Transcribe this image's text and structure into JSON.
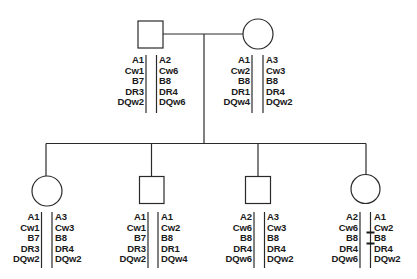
{
  "diagram": {
    "type": "pedigree",
    "line_color": "#2a2a2a",
    "loci": [
      "A",
      "C",
      "B",
      "DR",
      "DQ"
    ]
  },
  "parents": [
    {
      "id": "father",
      "sex": "male",
      "symbol": "square",
      "haplotype_left": [
        "A1",
        "Cw1",
        "B7",
        "DR3",
        "DQw2"
      ],
      "haplotype_right": [
        "A2",
        "Cw6",
        "B8",
        "DR4",
        "DQw6"
      ]
    },
    {
      "id": "mother",
      "sex": "female",
      "symbol": "circle",
      "haplotype_left": [
        "A1",
        "Cw2",
        "B8",
        "DR1",
        "DQw4"
      ],
      "haplotype_right": [
        "A3",
        "Cw3",
        "B8",
        "DR4",
        "DQw2"
      ]
    }
  ],
  "children": [
    {
      "id": "child-1",
      "sex": "female",
      "symbol": "circle",
      "haplotype_left": [
        "A1",
        "Cw1",
        "B7",
        "DR3",
        "DQw2"
      ],
      "haplotype_right": [
        "A3",
        "Cw3",
        "B8",
        "DR4",
        "DQw2"
      ],
      "recombination": false
    },
    {
      "id": "child-2",
      "sex": "male",
      "symbol": "square",
      "haplotype_left": [
        "A1",
        "Cw1",
        "B7",
        "DR3",
        "DQw2"
      ],
      "haplotype_right": [
        "A1",
        "Cw2",
        "B8",
        "DR1",
        "DQw4"
      ],
      "recombination": false
    },
    {
      "id": "child-3",
      "sex": "male",
      "symbol": "square",
      "haplotype_left": [
        "A2",
        "Cw6",
        "B8",
        "DR4",
        "DQw6"
      ],
      "haplotype_right": [
        "A3",
        "Cw3",
        "B8",
        "DR4",
        "DQw2"
      ],
      "recombination": false
    },
    {
      "id": "child-4",
      "sex": "female",
      "symbol": "circle",
      "haplotype_left": [
        "A2",
        "Cw6",
        "B8",
        "DR4",
        "DQw6"
      ],
      "haplotype_right": [
        "A1",
        "Cw2",
        "B8",
        "DR4",
        "DQw2"
      ],
      "recombination": true,
      "recombination_marks": [
        "between Cw2 and B8",
        "between B8 and DR4"
      ]
    }
  ]
}
